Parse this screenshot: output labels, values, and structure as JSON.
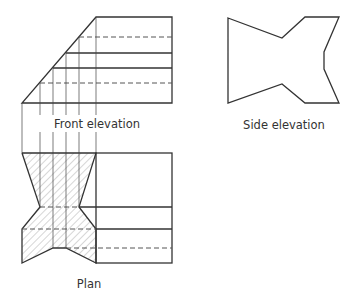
{
  "diagram": {
    "type": "orthographic-projection",
    "colors": {
      "line": "#333333",
      "hatch": "#888888",
      "background": "#ffffff"
    },
    "views": {
      "front_elevation": {
        "label": "Front elevation"
      },
      "side_elevation": {
        "label": "Side elevation"
      },
      "plan": {
        "label": "Plan"
      }
    }
  }
}
